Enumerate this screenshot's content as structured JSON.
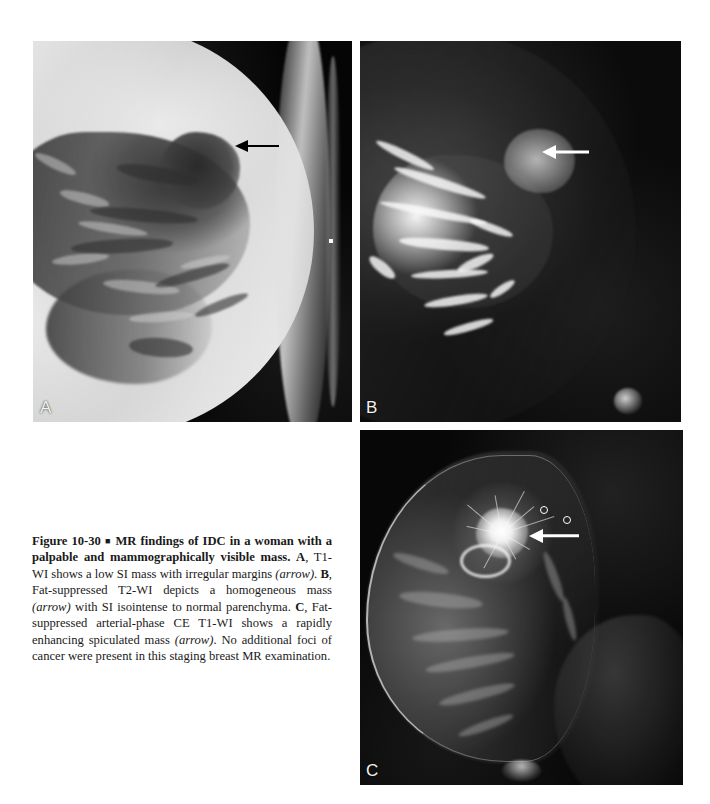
{
  "figure": {
    "number": "Figure 10-30",
    "separator": "■",
    "title": "MR findings of IDC in a woman with a palpable and mammographically visible mass.",
    "caption_parts": {
      "a_label": "A",
      "a_text": ", T1-WI shows a low SI mass with irregular margins ",
      "a_arrow": "(arrow)",
      "a_tail": ". ",
      "b_label": "B",
      "b_text": ", Fat-suppressed T2-WI depicts a homogeneous mass ",
      "b_arrow": "(arrow)",
      "b_tail": " with SI isointense to normal parenchyma. ",
      "c_label": "C",
      "c_text": ", Fat-suppressed arterial-phase CE T1-WI shows a rapidly enhancing spiculated mass ",
      "c_arrow": "(arrow)",
      "c_tail": ". No additional foci of cancer were present in this staging breast MR examination."
    },
    "full_caption": "Figure 10-30 ■ MR findings of IDC in a woman with a palpable and mammographically visible mass. A, T1-WI shows a low SI mass with irregular margins (arrow). B, Fat-suppressed T2-WI depicts a homogeneous mass (arrow) with SI isointense to normal parenchyma. C, Fat-suppressed arterial-phase CE T1-WI shows a rapidly enhancing spiculated mass (arrow). No additional foci of cancer were present in this staging breast MR examination."
  },
  "panels": [
    {
      "id": "a",
      "letter": "A",
      "modality": "T1-WI",
      "description": "Axial non-fat-suppressed T1-weighted image of the breast showing a low signal intensity mass with irregular margins",
      "arrow": {
        "name": "arrow-annotation-a",
        "color": "#000000",
        "direction": "left",
        "points_to": "low SI mass with irregular margins"
      },
      "markers": [
        {
          "type": "dot",
          "name": "image-marker-dot"
        }
      ]
    },
    {
      "id": "b",
      "letter": "B",
      "modality": "Fat-suppressed T2-WI",
      "description": "Fat-suppressed T2-weighted image depicting a homogeneous mass isointense to normal parenchyma",
      "arrow": {
        "name": "arrow-annotation-b",
        "color": "#ffffff",
        "direction": "left",
        "points_to": "homogeneous mass"
      },
      "markers": []
    },
    {
      "id": "c",
      "letter": "C",
      "modality": "Fat-suppressed arterial-phase CE T1-WI",
      "description": "Sagittal fat-suppressed contrast-enhanced arterial-phase T1-weighted image showing a rapidly enhancing spiculated mass",
      "arrow": {
        "name": "arrow-annotation-c",
        "color": "#ffffff",
        "direction": "left",
        "points_to": "rapidly enhancing spiculated mass"
      },
      "markers": [
        {
          "type": "ring",
          "name": "image-marker-ring-1"
        },
        {
          "type": "ring",
          "name": "image-marker-ring-2"
        }
      ]
    }
  ],
  "colors": {
    "page_background": "#ffffff",
    "panel_background": "#000000",
    "caption_text": "#1a1a1a",
    "arrow_dark": "#000000",
    "arrow_light": "#ffffff",
    "panel_letter": "#f2f2f2"
  }
}
